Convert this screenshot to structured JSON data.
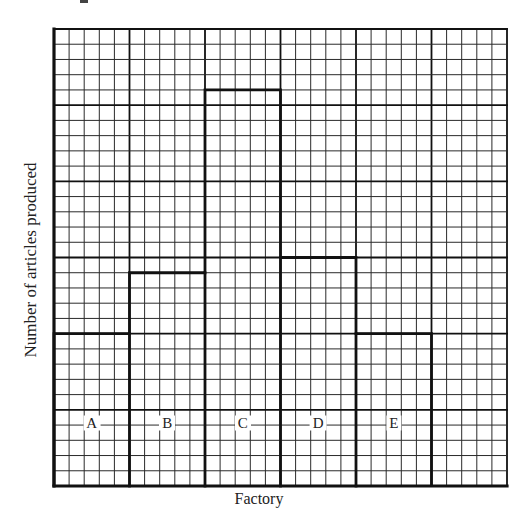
{
  "chart_data": {
    "type": "bar",
    "title": "",
    "xlabel": "Factory",
    "ylabel": "Number of articles produced",
    "categories": [
      "A",
      "B",
      "C",
      "D",
      "E"
    ],
    "values": [
      10,
      14,
      26,
      15,
      10
    ],
    "units": "grid squares (no numeric y-axis ticks shown)",
    "ylim": [
      0,
      30
    ],
    "grid": {
      "on": true,
      "columns": 30,
      "rows": 30,
      "major_every": 5
    },
    "bar_style": "outline only (step outline, no fill)",
    "legend": null
  },
  "colors": {
    "grid_minor": "#2a2a2a",
    "grid_major": "#111111",
    "bar_outline": "#111111",
    "background": "#ffffff"
  }
}
